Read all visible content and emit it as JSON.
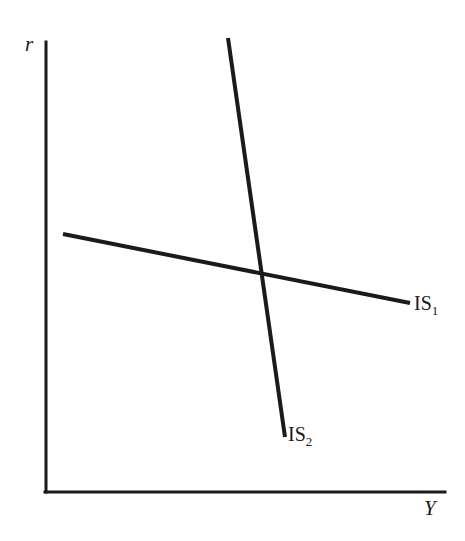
{
  "figure": {
    "background_color": "#ffffff",
    "ink_color": "#1a1a1a",
    "width": 465,
    "height": 541
  },
  "axes": {
    "y_axis_label": "r",
    "x_axis_label": "Y",
    "y_axis": {
      "x": 46,
      "y_top": 42,
      "y_bottom": 492
    },
    "x_axis": {
      "y": 492,
      "x_left": 45,
      "x_right": 445
    },
    "stroke_width": 3
  },
  "curves": [
    {
      "name": "IS1",
      "label_text": "IS",
      "label_subscript": "1",
      "description": "shallow downward-sloping IS curve",
      "x1": 63,
      "y1": 234,
      "x2": 410,
      "y2": 303,
      "stroke_width": 4
    },
    {
      "name": "IS2",
      "label_text": "IS",
      "label_subscript": "2",
      "description": "steep downward-sloping IS curve",
      "x1": 228,
      "y1": 38,
      "x2": 285,
      "y2": 437,
      "stroke_width": 4
    }
  ],
  "intersection": {
    "x": 262,
    "y": 271
  },
  "chart_data": {
    "type": "line",
    "title": "",
    "xlabel": "Y",
    "ylabel": "r",
    "grid": false,
    "legend": "none",
    "xlim": [
      45,
      445
    ],
    "ylim": [
      492,
      42
    ],
    "annotations": [
      "IS₁",
      "IS₂"
    ],
    "series": [
      {
        "name": "IS₁",
        "points": [
          [
            63,
            234
          ],
          [
            410,
            303
          ]
        ],
        "slope_description": "shallow negative slope"
      },
      {
        "name": "IS₂",
        "points": [
          [
            228,
            38
          ],
          [
            285,
            437
          ]
        ],
        "slope_description": "steep negative slope"
      }
    ]
  }
}
